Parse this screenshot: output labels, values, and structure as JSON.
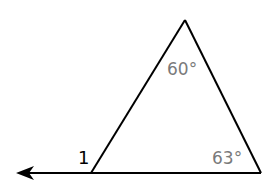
{
  "diagram": {
    "type": "triangle-exterior-angle",
    "vertices": {
      "apex": {
        "x": 185,
        "y": 20
      },
      "left": {
        "x": 91,
        "y": 173
      },
      "right": {
        "x": 261,
        "y": 173
      }
    },
    "ray": {
      "from": {
        "x": 261,
        "y": 173
      },
      "to": {
        "x": 16,
        "y": 173
      },
      "arrow": "left"
    },
    "labels": {
      "apex_angle": "60°",
      "right_angle": "63°",
      "exterior_angle": "1"
    },
    "colors": {
      "line": "#000000",
      "angle_label": "#7a7a7a",
      "exterior_label": "#000000"
    }
  }
}
